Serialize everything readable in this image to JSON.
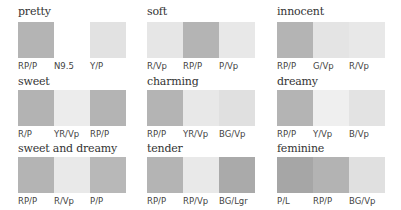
{
  "groups": [
    {
      "title": "pretty",
      "swatches": [
        {
          "label": "RP/P",
          "color": "#b4b4b4"
        },
        {
          "label": "N9.5",
          "color": "#ffffff"
        },
        {
          "label": "Y/P",
          "color": "#e2e2e2"
        }
      ]
    },
    {
      "title": "soft",
      "swatches": [
        {
          "label": "R/Vp",
          "color": "#e6e6e6"
        },
        {
          "label": "RP/P",
          "color": "#b4b4b4"
        },
        {
          "label": "P/Vp",
          "color": "#e8e8e8"
        }
      ]
    },
    {
      "title": "innocent",
      "swatches": [
        {
          "label": "RP/P",
          "color": "#b4b4b4"
        },
        {
          "label": "G/Vp",
          "color": "#e4e4e4"
        },
        {
          "label": "R/Vp",
          "color": "#e8e8e8"
        }
      ]
    },
    {
      "title": "sweet",
      "swatches": [
        {
          "label": "R/P",
          "color": "#b3b3b3"
        },
        {
          "label": "YR/Vp",
          "color": "#ececec"
        },
        {
          "label": "RP/P",
          "color": "#b4b4b4"
        }
      ]
    },
    {
      "title": "charming",
      "swatches": [
        {
          "label": "RP/P",
          "color": "#b4b4b4"
        },
        {
          "label": "YR/Vp",
          "color": "#e8e8e8"
        },
        {
          "label": "BG/Vp",
          "color": "#e0e0e0"
        }
      ]
    },
    {
      "title": "dreamy",
      "swatches": [
        {
          "label": "RP/P",
          "color": "#b4b4b4"
        },
        {
          "label": "Y/Vp",
          "color": "#efefef"
        },
        {
          "label": "B/Vp",
          "color": "#e3e3e3"
        }
      ]
    },
    {
      "title": "sweet and dreamy",
      "swatches": [
        {
          "label": "RP/P",
          "color": "#b4b4b4"
        },
        {
          "label": "R/Vp",
          "color": "#e9e9e9"
        },
        {
          "label": "P/P",
          "color": "#b8b8b8"
        }
      ]
    },
    {
      "title": "tender",
      "swatches": [
        {
          "label": "RP/P",
          "color": "#b4b4b4"
        },
        {
          "label": "RP/Vp",
          "color": "#e9e9e9"
        },
        {
          "label": "BG/Lgr",
          "color": "#aaaaaa"
        }
      ]
    },
    {
      "title": "feminine",
      "swatches": [
        {
          "label": "P/L",
          "color": "#a6a6a6"
        },
        {
          "label": "RP/P",
          "color": "#b3b3b3"
        },
        {
          "label": "BG/Vp",
          "color": "#e0e0e0"
        }
      ]
    }
  ]
}
